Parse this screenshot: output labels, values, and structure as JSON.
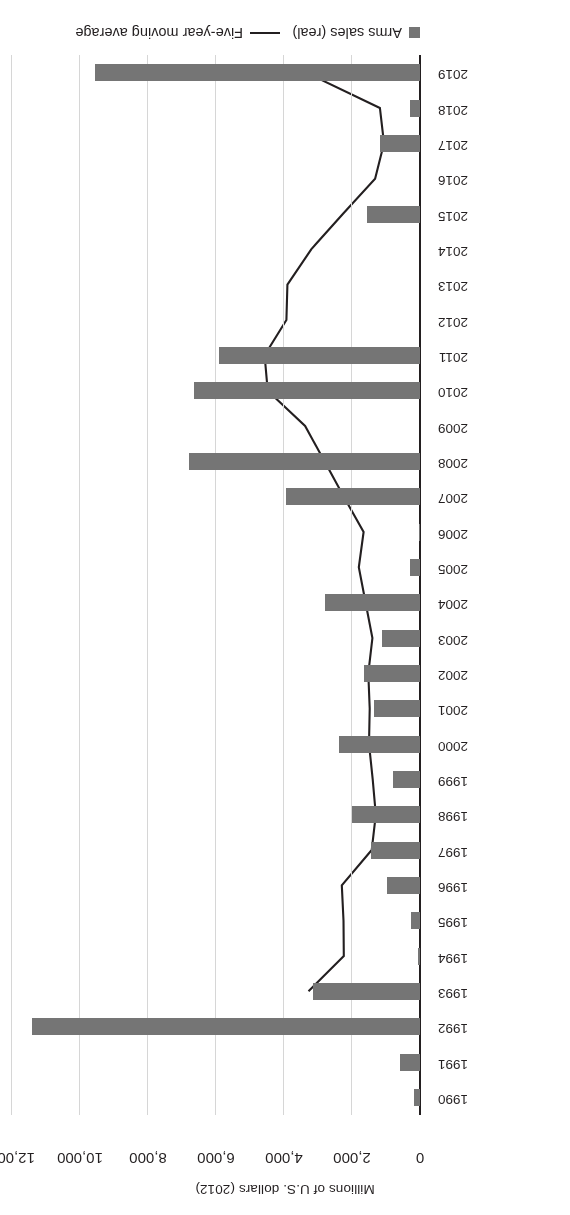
{
  "chart_data": {
    "type": "bar",
    "orientation": "horizontal",
    "title": "",
    "xlabel": "Millions of U.S. dollars (2012)",
    "ylabel": "",
    "xlim": [
      0,
      12000
    ],
    "xticks": [
      0,
      2000,
      4000,
      6000,
      8000,
      10000,
      12000
    ],
    "xticklabels": [
      "0",
      "2,000",
      "4,000",
      "6,000",
      "8,000",
      "10,000",
      "12,000"
    ],
    "grid": true,
    "legend_position": "bottom",
    "categories": [
      "1990",
      "1991",
      "1992",
      "1993",
      "1994",
      "1995",
      "1996",
      "1997",
      "1998",
      "1999",
      "2000",
      "2001",
      "2002",
      "2003",
      "2004",
      "2005",
      "2006",
      "2007",
      "2008",
      "2009",
      "2010",
      "2011",
      "2012",
      "2013",
      "2014",
      "2015",
      "2016",
      "2017",
      "2018",
      "2019"
    ],
    "series": [
      {
        "name": "Arms sales (real)",
        "type": "bar",
        "color": "#757575",
        "values": [
          180,
          590,
          11400,
          3150,
          60,
          260,
          970,
          1450,
          2000,
          790,
          2380,
          1350,
          1640,
          1110,
          2800,
          300,
          40,
          3950,
          6800,
          0,
          6650,
          5900,
          0,
          0,
          0,
          1560,
          0,
          1180,
          300,
          9550
        ]
      },
      {
        "name": "Five-year moving average",
        "type": "line",
        "color": "#231f20",
        "values": [
          null,
          null,
          null,
          3280,
          2240,
          2250,
          2300,
          1420,
          1300,
          1390,
          1500,
          1480,
          1520,
          1400,
          1600,
          1800,
          1660,
          2240,
          2810,
          3380,
          4480,
          4570,
          3930,
          3900,
          3200,
          2270,
          1320,
          1060,
          1180,
          3340
        ]
      }
    ]
  },
  "legend": {
    "items": [
      {
        "label": "Arms sales (real)",
        "marker": "square-swatch"
      },
      {
        "label": "Five-year moving average",
        "marker": "line-swatch"
      }
    ]
  }
}
